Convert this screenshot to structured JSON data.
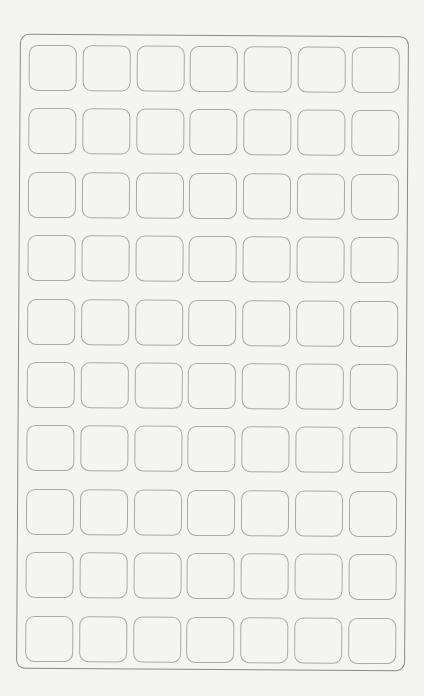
{
  "sheet": {
    "columns": 7,
    "rows": 10,
    "cells": [
      [
        "",
        "",
        "",
        "",
        "",
        "",
        ""
      ],
      [
        "",
        "",
        "",
        "",
        "",
        "",
        ""
      ],
      [
        "",
        "",
        "",
        "",
        "",
        "",
        ""
      ],
      [
        "",
        "",
        "",
        "",
        "",
        "",
        ""
      ],
      [
        "",
        "",
        "",
        "",
        "",
        "",
        ""
      ],
      [
        "",
        "",
        "",
        "",
        "",
        "",
        ""
      ],
      [
        "",
        "",
        "",
        "",
        "",
        "",
        ""
      ],
      [
        "",
        "",
        "",
        "",
        "",
        "",
        ""
      ],
      [
        "",
        "",
        "",
        "",
        "",
        "",
        ""
      ],
      [
        "",
        "",
        "",
        "",
        "",
        "",
        ""
      ]
    ],
    "colors": {
      "background": "#f4f4f2",
      "outer_border": "#8a8a8a",
      "cell_border": "#a9a9a9"
    }
  }
}
